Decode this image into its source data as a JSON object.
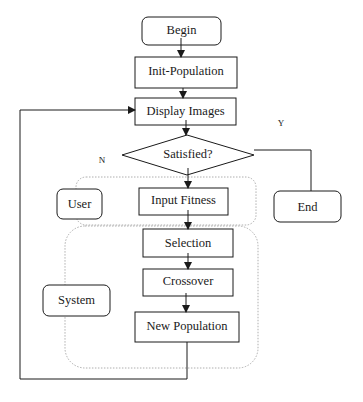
{
  "diagram": {
    "type": "flowchart",
    "nodes": {
      "begin": "Begin",
      "init_population": "Init-Population",
      "display_images": "Display Images",
      "satisfied": "Satisfied?",
      "input_fitness": "Input Fitness",
      "selection": "Selection",
      "crossover": "Crossover",
      "new_population": "New Population",
      "end": "End"
    },
    "groups": {
      "user": "User",
      "system": "System"
    },
    "edge_labels": {
      "yes": "Y",
      "no": "N"
    },
    "colors": {
      "stroke": "#1a1a1a",
      "group_border": "#9a9a9a",
      "background": "#ffffff"
    }
  }
}
